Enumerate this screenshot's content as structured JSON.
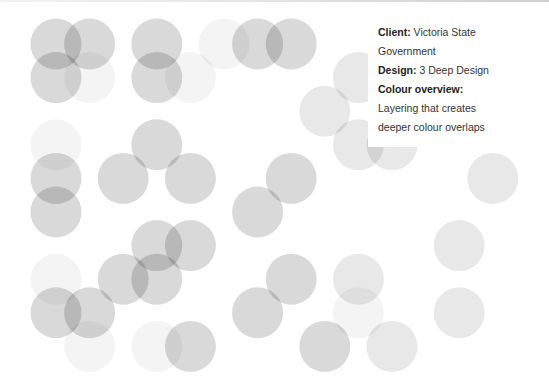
{
  "caption": {
    "client_label": "Client:",
    "client_value": "Victoria State Government",
    "design_label": "Design:",
    "design_value": "3 Deep Design",
    "overview_label": "Colour overview:",
    "overview_value": "Layering that creates deeper colour overlaps"
  },
  "palette": {
    "background": "#ffffff",
    "circle": "#000000",
    "text": "#333333"
  },
  "circles": [
    {
      "col": 0,
      "row": 0,
      "tone": "mid"
    },
    {
      "col": 1,
      "row": 0,
      "tone": "mid"
    },
    {
      "col": 0,
      "row": 1,
      "tone": "mid"
    },
    {
      "col": 1,
      "row": 1,
      "tone": "faint"
    },
    {
      "col": 3,
      "row": 0,
      "tone": "mid"
    },
    {
      "col": 3,
      "row": 1,
      "tone": "mid"
    },
    {
      "col": 4,
      "row": 1,
      "tone": "faint"
    },
    {
      "col": 5,
      "row": 0,
      "tone": "faint"
    },
    {
      "col": 6,
      "row": 0,
      "tone": "mid"
    },
    {
      "col": 7,
      "row": 0,
      "tone": "mid"
    },
    {
      "col": 9,
      "row": 1,
      "tone": "light"
    },
    {
      "col": 8,
      "row": 2,
      "tone": "light"
    },
    {
      "col": 9,
      "row": 3,
      "tone": "light"
    },
    {
      "col": 10,
      "row": 3,
      "tone": "light"
    },
    {
      "col": 0,
      "row": 3,
      "tone": "faint"
    },
    {
      "col": 0,
      "row": 4,
      "tone": "mid"
    },
    {
      "col": 0,
      "row": 5,
      "tone": "mid"
    },
    {
      "col": 2,
      "row": 4,
      "tone": "mid"
    },
    {
      "col": 3,
      "row": 3,
      "tone": "mid"
    },
    {
      "col": 4,
      "row": 4,
      "tone": "mid"
    },
    {
      "col": 7,
      "row": 4,
      "tone": "mid"
    },
    {
      "col": 6,
      "row": 5,
      "tone": "mid"
    },
    {
      "col": 13,
      "row": 4,
      "tone": "light"
    },
    {
      "col": 12,
      "row": 6,
      "tone": "light"
    },
    {
      "col": 3,
      "row": 6,
      "tone": "mid"
    },
    {
      "col": 4,
      "row": 6,
      "tone": "mid"
    },
    {
      "col": 2,
      "row": 7,
      "tone": "mid"
    },
    {
      "col": 3,
      "row": 7,
      "tone": "mid"
    },
    {
      "col": 0,
      "row": 7,
      "tone": "faint"
    },
    {
      "col": 0,
      "row": 8,
      "tone": "mid"
    },
    {
      "col": 1,
      "row": 8,
      "tone": "mid"
    },
    {
      "col": 1,
      "row": 9,
      "tone": "faint"
    },
    {
      "col": 3,
      "row": 9,
      "tone": "faint"
    },
    {
      "col": 4,
      "row": 9,
      "tone": "mid"
    },
    {
      "col": 7,
      "row": 7,
      "tone": "mid"
    },
    {
      "col": 6,
      "row": 8,
      "tone": "mid"
    },
    {
      "col": 9,
      "row": 7,
      "tone": "light"
    },
    {
      "col": 9,
      "row": 8,
      "tone": "faint"
    },
    {
      "col": 8,
      "row": 9,
      "tone": "mid"
    },
    {
      "col": 10,
      "row": 9,
      "tone": "light"
    },
    {
      "col": 12,
      "row": 8,
      "tone": "light"
    }
  ]
}
